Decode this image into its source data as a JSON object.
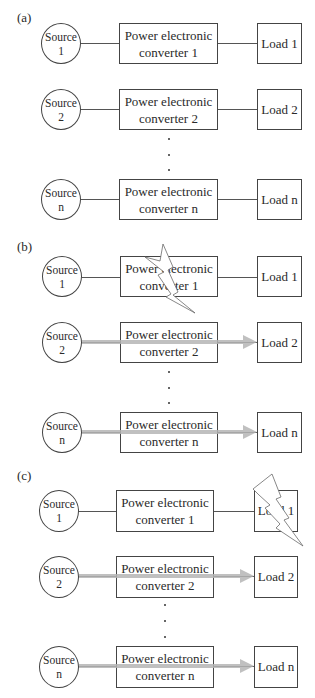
{
  "figure": {
    "panels": [
      {
        "label": "(a)",
        "rows": [
          {
            "source": [
              "Source",
              "1"
            ],
            "converter": [
              "Power electronic",
              "converter  1"
            ],
            "load": "Load 1",
            "power_flow": false
          },
          {
            "source": [
              "Source",
              "2"
            ],
            "converter": [
              "Power electronic",
              "converter  2"
            ],
            "load": "Load 2",
            "power_flow": false
          },
          {
            "source": [
              "Source",
              "n"
            ],
            "converter": [
              "Power electronic",
              "converter n"
            ],
            "load": "Load n",
            "power_flow": false
          }
        ],
        "fault": "none"
      },
      {
        "label": "(b)",
        "rows": [
          {
            "source": [
              "Source",
              "1"
            ],
            "converter": [
              "Power electronic",
              "converter  1"
            ],
            "load": "Load 1",
            "power_flow": false
          },
          {
            "source": [
              "Source",
              "2"
            ],
            "converter": [
              "Power electronic",
              "converter  2"
            ],
            "load": "Load 2",
            "power_flow": true
          },
          {
            "source": [
              "Source",
              "n"
            ],
            "converter": [
              "Power electronic",
              "converter n"
            ],
            "load": "Load n",
            "power_flow": true
          }
        ],
        "fault": "converter 1"
      },
      {
        "label": "(c)",
        "rows": [
          {
            "source": [
              "Source",
              "1"
            ],
            "converter": [
              "Power electronic",
              "converter  1"
            ],
            "load": "Load 1",
            "power_flow": false
          },
          {
            "source": [
              "Source",
              "2"
            ],
            "converter": [
              "Power electronic",
              "converter  2"
            ],
            "load": "Load 2",
            "power_flow": true
          },
          {
            "source": [
              "Source",
              "n"
            ],
            "converter": [
              "Power electronic",
              "converter n"
            ],
            "load": "Load n",
            "power_flow": true
          }
        ],
        "fault": "load 1"
      }
    ],
    "ellipsis": "⋮",
    "icons": {
      "fault": "lightning-bolt-icon",
      "flow": "arrow-right-icon"
    },
    "colors": {
      "line": "#444444",
      "arrow": "#b5b5b5",
      "bolt_fill": "#ffffff",
      "bolt_stroke": "#666666"
    }
  }
}
